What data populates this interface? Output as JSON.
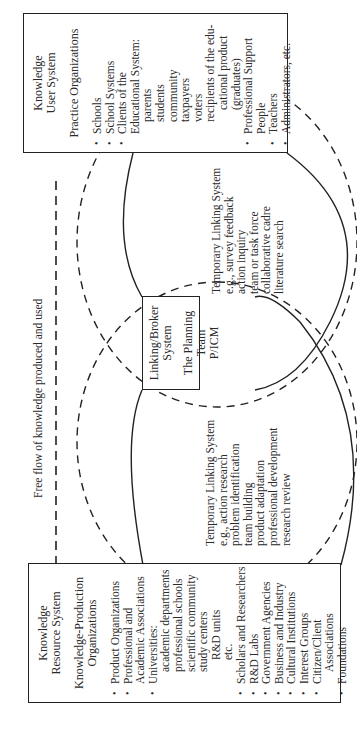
{
  "figure": {
    "orientation": "rotated 90 degrees counter-clockwise",
    "flow_label": "Free flow of knowledge produced and used",
    "resource_system": {
      "title_lines": [
        "Knowledge",
        "Resource System"
      ],
      "subtitle_lines": [
        "Knowledge-Production",
        "Organizations"
      ],
      "items": [
        {
          "text": "Product Organizations",
          "level": 0,
          "bullet": true
        },
        {
          "text": "Professional and",
          "level": 0,
          "bullet": true
        },
        {
          "text": "Academic Associations",
          "level": 0,
          "bullet": false
        },
        {
          "text": "Universities:",
          "level": 0,
          "bullet": true
        },
        {
          "text": "academic departments",
          "level": 1,
          "bullet": false
        },
        {
          "text": "professional schools",
          "level": 1,
          "bullet": false
        },
        {
          "text": "scientific community",
          "level": 1,
          "bullet": false
        },
        {
          "text": "study centers",
          "level": 1,
          "bullet": false
        },
        {
          "text": "R&D units",
          "level": 2,
          "bullet": false
        },
        {
          "text": "etc.",
          "level": 2,
          "bullet": false
        },
        {
          "text": "Scholars and Researchers",
          "level": 0,
          "bullet": true
        },
        {
          "text": "R&D Labs",
          "level": 0,
          "bullet": true
        },
        {
          "text": "Government Agencies",
          "level": 0,
          "bullet": true
        },
        {
          "text": "Business and Industry",
          "level": 0,
          "bullet": true
        },
        {
          "text": "Cultural Institutions",
          "level": 0,
          "bullet": true
        },
        {
          "text": "Interest Groups",
          "level": 0,
          "bullet": true
        },
        {
          "text": "Citizen/Client",
          "level": 0,
          "bullet": true
        },
        {
          "text": "Associations",
          "level": 1,
          "bullet": false
        },
        {
          "text": "Foundations",
          "level": 0,
          "bullet": true
        }
      ]
    },
    "user_system": {
      "title_lines": [
        "Knowledge",
        "User System"
      ],
      "subtitle_lines": [
        "Practice Organizations"
      ],
      "items": [
        {
          "text": "Schools",
          "level": 0,
          "bullet": true
        },
        {
          "text": "School Systems",
          "level": 0,
          "bullet": true
        },
        {
          "text": "Clients of the",
          "level": 0,
          "bullet": true
        },
        {
          "text": "Educational System:",
          "level": 0,
          "bullet": false
        },
        {
          "text": "parents",
          "level": 1,
          "bullet": false
        },
        {
          "text": "students",
          "level": 1,
          "bullet": false
        },
        {
          "text": "community",
          "level": 1,
          "bullet": false
        },
        {
          "text": "taxpayers",
          "level": 1,
          "bullet": false
        },
        {
          "text": "voters",
          "level": 1,
          "bullet": false
        },
        {
          "text": "recipients of the edu-",
          "level": 1,
          "bullet": false
        },
        {
          "text": "cational product",
          "level": 2,
          "bullet": false
        },
        {
          "text": "(graduates)",
          "level": 2,
          "bullet": false
        },
        {
          "text": "Professional Support",
          "level": 0,
          "bullet": true
        },
        {
          "text": "People",
          "level": 0,
          "bullet": false
        },
        {
          "text": "Teachers",
          "level": 0,
          "bullet": true
        },
        {
          "text": "Administrators, etc.",
          "level": 0,
          "bullet": true
        }
      ]
    },
    "broker_system": {
      "lines": [
        "Linking/Broker System",
        "",
        "The Planning Team",
        "P/ICM"
      ]
    },
    "temp_linking_left": {
      "lines": [
        "Temporary Linking System",
        "e.g., action research",
        "problem identification",
        "team building",
        "product adaptation",
        "professional development",
        "research review"
      ]
    },
    "temp_linking_right": {
      "lines": [
        "Temporary Linking System",
        "e.g., survey feedback",
        "action inquiry",
        "team or task force",
        "collaborative cadre",
        "literature search"
      ]
    }
  }
}
